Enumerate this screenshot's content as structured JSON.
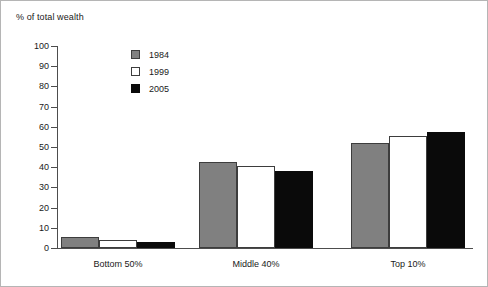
{
  "chart_data": {
    "type": "bar",
    "title": "% of total wealth",
    "xlabel": "",
    "ylabel": "% of total wealth",
    "ylim": [
      0,
      100
    ],
    "ytick_step": 10,
    "yticks": [
      100,
      90,
      80,
      70,
      60,
      50,
      40,
      30,
      20,
      10,
      0
    ],
    "ytick_labels": [
      "100",
      "90",
      "80",
      "70",
      "60",
      "50",
      "40",
      "30",
      "20",
      "10",
      "0"
    ],
    "grid": false,
    "legend_position": "upper-left-inside",
    "categories": [
      "Bottom 50%",
      "Middle 40%",
      "Top 10%"
    ],
    "series": [
      {
        "name": "1984",
        "color": "#808080",
        "values": [
          5.5,
          42.5,
          52.0
        ]
      },
      {
        "name": "1999",
        "color": "#ffffff",
        "values": [
          4.0,
          40.5,
          55.5
        ]
      },
      {
        "name": "2005",
        "color": "#0a0a0a",
        "values": [
          2.8,
          38.0,
          57.5
        ]
      }
    ]
  }
}
